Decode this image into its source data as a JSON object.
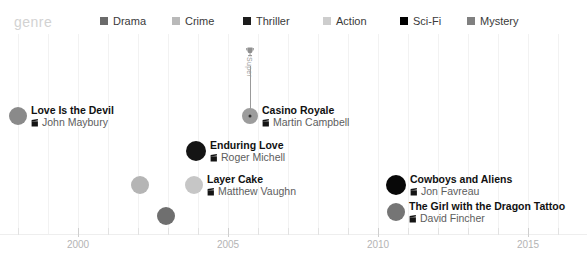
{
  "legend": {
    "title": "genre",
    "items": [
      {
        "label": "Drama",
        "color": "#6b6b6b",
        "x": 100
      },
      {
        "label": "Crime",
        "color": "#b9b9b9",
        "x": 172
      },
      {
        "label": "Thriller",
        "color": "#1c1c1c",
        "x": 243
      },
      {
        "label": "Action",
        "color": "#cdcdcd",
        "x": 323
      },
      {
        "label": "Sci-Fi",
        "color": "#000000",
        "x": 400
      },
      {
        "label": "Mystery",
        "color": "#808080",
        "x": 467
      }
    ]
  },
  "axis": {
    "label_color": "#b4b4b4",
    "ticks": [
      {
        "value": "",
        "x": 18,
        "major": false
      },
      {
        "value": "2000",
        "x": 78,
        "major": true
      },
      {
        "value": "",
        "x": 108,
        "major": false
      },
      {
        "value": "",
        "x": 138,
        "major": false
      },
      {
        "value": "",
        "x": 168,
        "major": false
      },
      {
        "value": "",
        "x": 198,
        "major": false
      },
      {
        "value": "2005",
        "x": 228,
        "major": true
      },
      {
        "value": "",
        "x": 258,
        "major": false
      },
      {
        "value": "",
        "x": 288,
        "major": false
      },
      {
        "value": "",
        "x": 318,
        "major": false
      },
      {
        "value": "",
        "x": 348,
        "major": false
      },
      {
        "value": "2010",
        "x": 378,
        "major": true
      },
      {
        "value": "",
        "x": 408,
        "major": false
      },
      {
        "value": "",
        "x": 438,
        "major": false
      },
      {
        "value": "",
        "x": 468,
        "major": false
      },
      {
        "value": "",
        "x": 498,
        "major": false
      },
      {
        "value": "2015",
        "x": 528,
        "major": true
      },
      {
        "value": "",
        "x": 558,
        "major": false
      }
    ],
    "gridlines_x": [
      18,
      48,
      78,
      108,
      138,
      168,
      198,
      228,
      258,
      288,
      318,
      348,
      378,
      408,
      438,
      468,
      498,
      528,
      558
    ]
  },
  "annotation": {
    "text": "Super",
    "icon": "trophy-icon",
    "x": 250,
    "top": 44,
    "bottom": 116,
    "color": "#9a9a9a"
  },
  "chart_data": {
    "type": "scatter",
    "title": "",
    "xlabel": "",
    "ylabel": "",
    "xlim": [
      1998,
      2016
    ],
    "grid": true,
    "legend_position": "top",
    "points": [
      {
        "title": "Love Is the Devil",
        "director": "John Maybury",
        "genre": "Mystery",
        "color": "#8a8a8a",
        "x": 18,
        "y": 116,
        "r": 9,
        "side": "right",
        "center_dot": false
      },
      {
        "title": "Casino Royale",
        "director": "Martin Campbell",
        "genre": "Mystery",
        "color": "#9c9c9c",
        "x": 250,
        "y": 116,
        "r": 8,
        "side": "right",
        "center_dot": true
      },
      {
        "title": "Enduring Love",
        "director": "Roger Michell",
        "genre": "Thriller",
        "color": "#141414",
        "x": 196,
        "y": 151,
        "r": 10,
        "side": "right",
        "center_dot": false
      },
      {
        "title": "Road to Perdition",
        "director": "Sam Mendes",
        "genre": "Crime",
        "color": "#b5b5b5",
        "x": 140,
        "y": 185,
        "r": 9,
        "side": "left",
        "center_dot": false
      },
      {
        "title": "Layer Cake",
        "director": "Matthew Vaughn",
        "genre": "Action",
        "color": "#c6c6c6",
        "x": 194,
        "y": 185,
        "r": 9,
        "side": "right",
        "center_dot": false
      },
      {
        "title": "Cowboys and Aliens",
        "director": "Jon Favreau",
        "genre": "Sci-Fi",
        "color": "#080808",
        "x": 396,
        "y": 185,
        "r": 10,
        "side": "right",
        "center_dot": false
      },
      {
        "title": "Sylvia",
        "director": "Christine Jeffs",
        "genre": "Drama",
        "color": "#6f6f6f",
        "x": 166,
        "y": 216,
        "r": 9,
        "side": "left",
        "center_dot": false
      },
      {
        "title": "The Girl with the Dragon Tattoo",
        "director": "David Fincher",
        "genre": "Mystery",
        "color": "#757575",
        "x": 396,
        "y": 212,
        "r": 9,
        "side": "right",
        "center_dot": false
      }
    ]
  }
}
